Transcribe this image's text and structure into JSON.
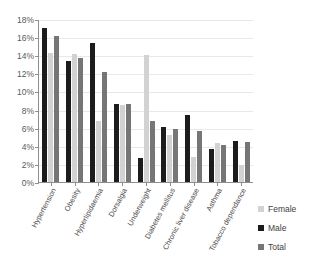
{
  "chart_data": {
    "type": "bar",
    "title": "",
    "xlabel": "",
    "ylabel": "",
    "ylim": [
      0,
      18
    ],
    "ytick_labels": [
      "18%",
      "16%",
      "14%",
      "12%",
      "10%",
      "8%",
      "6%",
      "4%",
      "2%",
      "0%"
    ],
    "ytick_values": [
      18,
      16,
      14,
      12,
      10,
      8,
      6,
      4,
      2,
      0
    ],
    "grid": true,
    "legend_position": "right",
    "units": "percent",
    "categories": [
      "Hypertension",
      "Obesity",
      "Hyperlipidaemia",
      "Dorsalgia",
      "Underweight",
      "Diabetes mellitus",
      "Chronic liver disease",
      "Asthma",
      "Tobacco dependance"
    ],
    "series": [
      {
        "name": "Male",
        "color": "#1c1c1c",
        "values": [
          17.0,
          13.4,
          15.3,
          8.6,
          2.7,
          6.1,
          7.4,
          3.7,
          4.5
        ]
      },
      {
        "name": "Female",
        "color": "#d2d2d2",
        "values": [
          14.2,
          14.1,
          6.7,
          8.5,
          14.0,
          5.2,
          2.8,
          4.3,
          1.9
        ]
      },
      {
        "name": "Total",
        "color": "#767676",
        "values": [
          16.1,
          13.7,
          12.2,
          8.6,
          6.7,
          5.8,
          5.6,
          4.1,
          4.4
        ]
      }
    ]
  },
  "legend": {
    "items": [
      {
        "label": "Female",
        "key": "female"
      },
      {
        "label": "Male",
        "key": "male"
      },
      {
        "label": "Total",
        "key": "total"
      }
    ]
  }
}
